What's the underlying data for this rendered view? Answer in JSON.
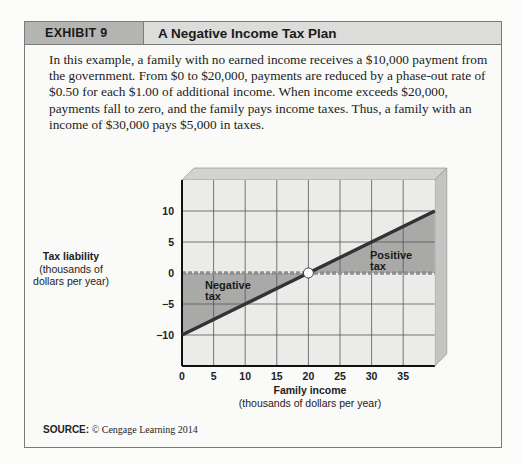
{
  "exhibit": {
    "number": "EXHIBIT 9",
    "title": "A Negative Income Tax Plan",
    "description": "In this example, a family with no earned income receives a $10,000 payment from the government. From $0 to $20,000, payments are reduced by a phase-out rate of $0.50 for each $1.00 of additional income. When income exceeds $20,000, payments fall to zero, and the family pays income taxes. Thus, a family with an income of $30,000 pays $5,000 in taxes.",
    "source_label": "SOURCE:",
    "source_text": "© Cengage Learning 2014"
  },
  "chart_data": {
    "type": "line",
    "title": "A Negative Income Tax Plan",
    "xlabel": "Family income",
    "xlabel_sub": "(thousands of dollars per year)",
    "ylabel": "Tax liability",
    "ylabel_sub": "(thousands of dollars per year)",
    "x_ticks": [
      0,
      5,
      10,
      15,
      20,
      25,
      30,
      35
    ],
    "y_ticks": [
      10,
      5,
      0,
      -5,
      -10
    ],
    "xlim": [
      0,
      40
    ],
    "ylim": [
      -15,
      15
    ],
    "grid": true,
    "series": [
      {
        "name": "Tax liability",
        "x": [
          0,
          5,
          10,
          15,
          20,
          25,
          30,
          35,
          40
        ],
        "y": [
          -10,
          -7.5,
          -5,
          -2.5,
          0,
          2.5,
          5,
          7.5,
          10
        ]
      }
    ],
    "break_even_point": {
      "x": 20,
      "y": 0
    },
    "annotations": [
      {
        "text": "Negative tax",
        "region": "below zero, income 0–20"
      },
      {
        "text": "Positive tax",
        "region": "above zero, income 20–40"
      }
    ],
    "zero_line_style": "dashed"
  }
}
